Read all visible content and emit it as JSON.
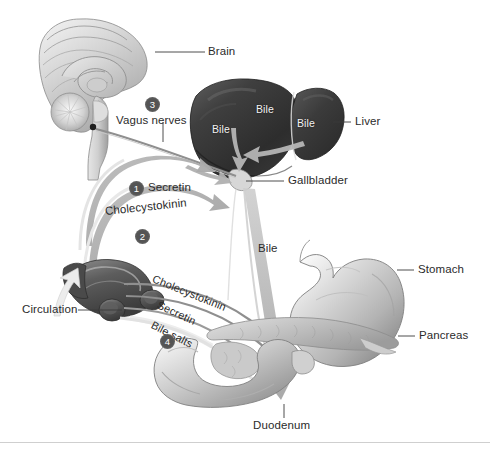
{
  "figure": {
    "domain": "anatomical-diagram",
    "background_color": "#ffffff",
    "line_color": "#3a3a3a",
    "arrow_color": "#9a9a9a",
    "liver_color": "#3c3c3c",
    "organ_color": "#b9b9b9",
    "number_badge_color": "#545454"
  },
  "labels": {
    "brain": "Brain",
    "vagus_nerves": "Vagus nerves",
    "liver": "Liver",
    "gallbladder": "Gallbladder",
    "stomach": "Stomach",
    "pancreas": "Pancreas",
    "duodenum": "Duodenum",
    "circulation": "Circulation",
    "secretin": "Secretin",
    "cholecystokinin": "Cholecystokinin",
    "bile_duct_arrow": "Bile",
    "bile_liver_1": "Bile",
    "bile_liver_2": "Bile",
    "bile_liver_3": "Bile",
    "curve_cholecystokinin": "Cholecystokinin",
    "curve_secretin": "Secretin",
    "curve_bile_salts": "Bile salts"
  },
  "steps": [
    {
      "number": "1",
      "label": "Secretin"
    },
    {
      "number": "2",
      "label": "Cholecystokinin"
    },
    {
      "number": "3",
      "label": "Vagus nerves"
    },
    {
      "number": "4",
      "label": "Bile salts"
    }
  ],
  "leader_lines": [
    {
      "name": "brain",
      "from": [
        155,
        52
      ],
      "to": [
        205,
        52
      ]
    },
    {
      "name": "vagus-nerves",
      "from": [
        163,
        122
      ],
      "to": [
        163,
        140
      ]
    },
    {
      "name": "liver",
      "from": [
        333,
        122
      ],
      "to": [
        351,
        122
      ]
    },
    {
      "name": "gallbladder",
      "from": [
        246,
        180
      ],
      "to": [
        284,
        180
      ]
    },
    {
      "name": "stomach",
      "from": [
        397,
        270
      ],
      "to": [
        414,
        270
      ]
    },
    {
      "name": "pancreas",
      "from": [
        398,
        336
      ],
      "to": [
        415,
        336
      ]
    },
    {
      "name": "duodenum",
      "from": [
        284,
        404
      ],
      "to": [
        284,
        418
      ]
    },
    {
      "name": "circulation",
      "from": [
        78,
        310
      ],
      "to": [
        122,
        310
      ]
    }
  ]
}
